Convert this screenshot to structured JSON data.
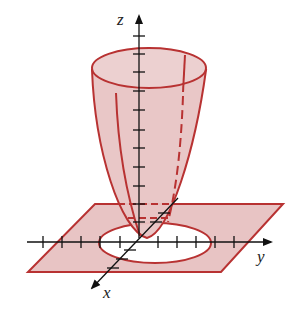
{
  "figure": {
    "axes": {
      "x_label": "x",
      "y_label": "y",
      "z_label": "z"
    },
    "colors": {
      "surface_fill": "#e8c4c4",
      "surface_stroke": "#b83232",
      "axis": "#111111",
      "background": "#ffffff"
    }
  }
}
